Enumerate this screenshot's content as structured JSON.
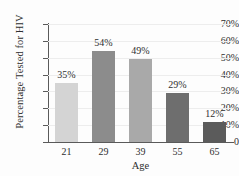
{
  "chart_data": {
    "type": "bar",
    "title": "",
    "categories": [
      "21",
      "29",
      "39",
      "55",
      "65"
    ],
    "values": [
      35,
      54,
      49,
      29,
      12
    ],
    "value_labels": [
      "35%",
      "54%",
      "49%",
      "29%",
      "12%"
    ],
    "xlabel": "Age",
    "ylabel": "Percentage Tested for HIV",
    "ylim": [
      0,
      70
    ],
    "ytick_values": [
      0,
      10,
      20,
      30,
      40,
      50,
      60,
      70
    ],
    "ytick_labels": [
      "0",
      "10%",
      "20%",
      "30%",
      "40%",
      "50%",
      "60%",
      "70%"
    ],
    "grid": true,
    "legend": "none",
    "bar_colors": [
      "#d4d4d4",
      "#8c8c8c",
      "#a9a9a9",
      "#6e6e6e",
      "#5b5b5b"
    ],
    "axis_color": "#5a5a5a",
    "gridline_color": "#ededed",
    "background_color": "#fdfdfd",
    "text_color": "#2e2e2e"
  }
}
